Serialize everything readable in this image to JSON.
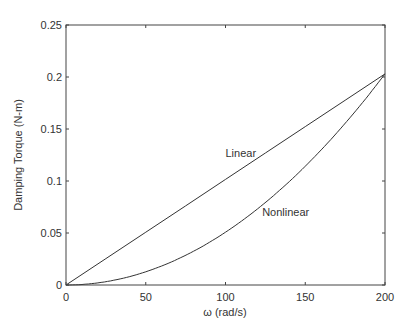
{
  "chart_data": {
    "type": "line",
    "title": "",
    "xlabel": "ω (rad/s)",
    "ylabel": "Damping Torque (N-m)",
    "xlim": [
      0,
      200
    ],
    "ylim": [
      0,
      0.25
    ],
    "xticks": [
      0,
      50,
      100,
      150,
      200
    ],
    "xtick_labels": [
      "0",
      "50",
      "100",
      "150",
      "200"
    ],
    "yticks": [
      0,
      0.05,
      0.1,
      0.15,
      0.2,
      0.25
    ],
    "ytick_labels": [
      "0",
      "0.05",
      "0.1",
      "0.15",
      "0.2",
      "0.25"
    ],
    "grid": false,
    "legend": "none (inline annotations)",
    "x": [
      0,
      25,
      50,
      75,
      100,
      125,
      150,
      175,
      200
    ],
    "series": [
      {
        "name": "Linear",
        "values": [
          0,
          0.0254,
          0.0508,
          0.0761,
          0.1015,
          0.1269,
          0.1523,
          0.1776,
          0.203
        ]
      },
      {
        "name": "Nonlinear",
        "values": [
          0,
          0.0032,
          0.0127,
          0.0285,
          0.0508,
          0.0793,
          0.1142,
          0.1554,
          0.203
        ]
      }
    ],
    "annotations": [
      {
        "text": "Linear",
        "x": 100,
        "y": 0.123
      },
      {
        "text": "Nonlinear",
        "x": 123,
        "y": 0.066
      }
    ]
  }
}
